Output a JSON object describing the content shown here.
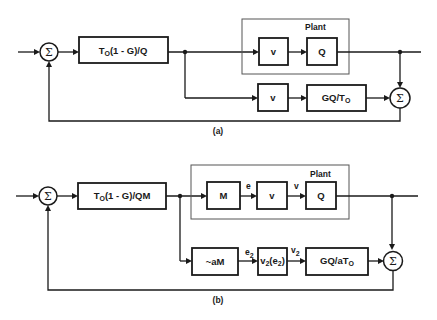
{
  "diagram_a": {
    "caption": "(a)",
    "sum_input": "Σ",
    "controller": {
      "label_main": "T",
      "label_sub": "O",
      "label_rest": "(1 - G)/Q"
    },
    "plant": {
      "title": "Plant",
      "blocks": [
        "v",
        "Q"
      ]
    },
    "model_path": {
      "blocks": [
        "v"
      ],
      "model": {
        "label_main": "GQ/T",
        "label_sub": "O"
      }
    },
    "sum_output": "Σ"
  },
  "diagram_b": {
    "caption": "(b)",
    "sum_input": "Σ",
    "controller": {
      "label_main": "T",
      "label_sub": "O",
      "label_rest": "(1 - G)/QM"
    },
    "plant": {
      "title": "Plant",
      "blocks": [
        "M",
        "v",
        "Q"
      ],
      "signals": [
        "e",
        "v"
      ]
    },
    "model_path": {
      "approx_block": "~aM",
      "nonlinear_block": {
        "main": "v",
        "sub": "2",
        "arg_main": "(e",
        "arg_sub": "2",
        "close": ")"
      },
      "signals": [
        {
          "main": "e",
          "sub": "2"
        },
        {
          "main": "v",
          "sub": "2"
        }
      ],
      "model": {
        "label_main": "GQ/aT",
        "label_sub": "O"
      }
    },
    "sum_output": "Σ"
  }
}
